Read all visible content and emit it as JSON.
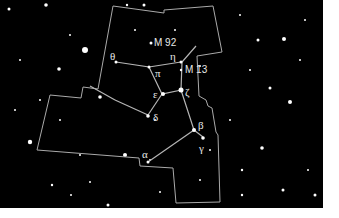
{
  "chart": {
    "constellation_labels": {
      "theta": "θ",
      "pi": "π",
      "eta": "η",
      "epsilon": "ε",
      "zeta": "ζ",
      "delta": "δ",
      "beta": "β",
      "gamma": "γ",
      "alpha": "α"
    },
    "objects": {
      "m92": "M 92",
      "m13": "M 13"
    }
  },
  "colors": {
    "sky": "#000000",
    "lines": "#bbbbbb",
    "labels": "#e8e8e8",
    "margin": "#ffffff"
  }
}
